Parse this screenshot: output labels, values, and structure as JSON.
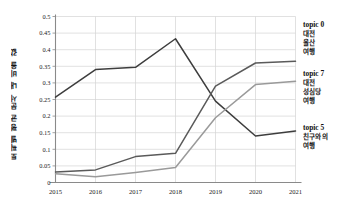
{
  "chart_data": {
    "type": "line",
    "title": "",
    "xlabel": "",
    "ylabel": "토픽별 평균 문서 내 비율 값",
    "x": [
      "2015",
      "2016",
      "2017",
      "2018",
      "2019",
      "2020",
      "2021"
    ],
    "categories": [
      "2015",
      "2016",
      "2017",
      "2018",
      "2019",
      "2020",
      "2021"
    ],
    "ylim": [
      0,
      0.5
    ],
    "xlim": [
      "2015",
      "2021"
    ],
    "yticks": [
      "0",
      "0.05",
      "0.1",
      "0.15",
      "0.2",
      "0.25",
      "0.3",
      "0.35",
      "0.4",
      "0.45",
      "0.5"
    ],
    "ytick_values": [
      0,
      0.05,
      0.1,
      0.15,
      0.2,
      0.25,
      0.3,
      0.35,
      0.4,
      0.45,
      0.5
    ],
    "grid": true,
    "legend_position": "right",
    "series": [
      {
        "name": "topic 0 대전 울산 여행",
        "label_title": "topic 0",
        "label_lines": [
          "대전",
          "울산",
          "여행"
        ],
        "color": "#3d3d3d",
        "values": [
          0.257,
          0.34,
          0.347,
          0.433,
          0.245,
          0.14,
          0.155
        ]
      },
      {
        "name": "topic 7 대전 성심당 여행",
        "label_title": "topic 7",
        "label_lines": [
          "대전",
          "성심당",
          "여행"
        ],
        "color": "#9a9a9a",
        "values": [
          0.026,
          0.017,
          0.03,
          0.045,
          0.195,
          0.295,
          0.305
        ]
      },
      {
        "name": "topic 5 친구와의 여행",
        "label_title": "topic 5",
        "label_lines": [
          "친구와의",
          "여행"
        ],
        "color": "#5a5a5a",
        "values": [
          0.032,
          0.038,
          0.078,
          0.088,
          0.29,
          0.36,
          0.365
        ]
      }
    ]
  },
  "legend": {
    "topic0": {
      "title": "topic 0",
      "line1": "대전",
      "line2": "울산",
      "line3": "여행"
    },
    "topic7": {
      "title": "topic 7",
      "line1": "대전",
      "line2": "성심당",
      "line3": "여행"
    },
    "topic5": {
      "title": "topic 5",
      "line1": "친구와의",
      "line2": "여행"
    }
  },
  "axes": {
    "y_title": "토픽별 평균 문서 내 비율 값"
  }
}
